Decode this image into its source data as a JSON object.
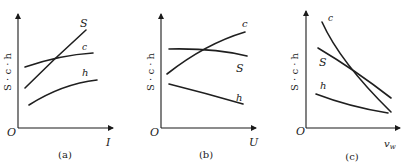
{
  "panels": [
    {
      "id": "a",
      "caption": "(a)",
      "origin_label": "O",
      "y_axis_label": "S · c · h",
      "x_axis_label": "I",
      "curves": [
        {
          "name": "S",
          "label": "S",
          "trend": "increasing steeply"
        },
        {
          "name": "c",
          "label": "c",
          "trend": "increasing then flattening"
        },
        {
          "name": "h",
          "label": "h",
          "trend": "increasing gradually"
        }
      ]
    },
    {
      "id": "b",
      "caption": "(b)",
      "origin_label": "O",
      "y_axis_label": "S · c · h",
      "x_axis_label": "U",
      "curves": [
        {
          "name": "c",
          "label": "c",
          "trend": "increasing"
        },
        {
          "name": "S",
          "label": "S",
          "trend": "flat then slightly decreasing"
        },
        {
          "name": "h",
          "label": "h",
          "trend": "decreasing gradually"
        }
      ]
    },
    {
      "id": "c",
      "caption": "(c)",
      "origin_label": "O",
      "y_axis_label": "S · c · h",
      "x_axis_label": "v",
      "x_axis_subscript": "w",
      "curves": [
        {
          "name": "c",
          "label": "c",
          "trend": "decreasing steeply"
        },
        {
          "name": "S",
          "label": "S",
          "trend": "decreasing"
        },
        {
          "name": "h",
          "label": "h",
          "trend": "decreasing gradually"
        }
      ]
    }
  ]
}
